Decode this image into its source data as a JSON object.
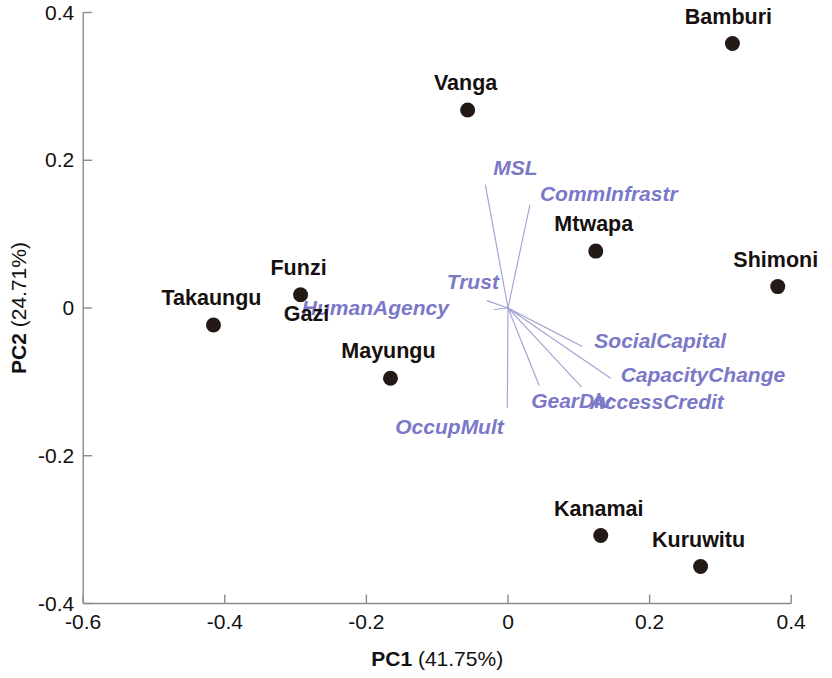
{
  "chart_data": {
    "type": "scatter",
    "title": "",
    "subtitle": "",
    "xlabel_prefix": "PC1",
    "xlabel_variance": "(41.75%)",
    "ylabel_prefix": "PC2",
    "ylabel_variance": "(24.71%)",
    "xlabel": "PC1 (41.75%)",
    "ylabel": "PC2 (24.71%)",
    "xlim": [
      -0.6,
      0.4
    ],
    "ylim": [
      -0.4,
      0.4
    ],
    "xticks": [
      -0.6,
      -0.4,
      -0.2,
      0,
      0.2,
      0.4
    ],
    "xtick_labels": [
      "-0.6",
      "-0.4",
      "-0.2",
      "0",
      "0.2",
      "0.4"
    ],
    "yticks": [
      -0.4,
      -0.2,
      0,
      0.2,
      0.4
    ],
    "ytick_labels": [
      "-0.4",
      "-0.2",
      "0",
      "0.2",
      "0.4"
    ],
    "grid": false,
    "legend": "none",
    "point_color": "#231a16",
    "vector_color": "#7b78c8",
    "sites": [
      {
        "label": "Bamburi",
        "x": 0.317,
        "y": 0.358,
        "label_dx": -4,
        "label_dy": -20
      },
      {
        "label": "Vanga",
        "x": -0.057,
        "y": 0.268,
        "label_dx": -2,
        "label_dy": -20
      },
      {
        "label": "Mtwapa",
        "x": 0.124,
        "y": 0.077,
        "label_dx": -2,
        "label_dy": -20
      },
      {
        "label": "Shimoni",
        "x": 0.381,
        "y": 0.029,
        "label_dx": -2,
        "label_dy": -20
      },
      {
        "label": "Funzi",
        "x": -0.293,
        "y": 0.018,
        "label_dx": -2,
        "label_dy": -20
      },
      {
        "label": "Gazi",
        "x": -0.293,
        "y": 0.018,
        "label_dx": 6,
        "label_dy": 26
      },
      {
        "label": "Takaungu",
        "x": -0.416,
        "y": -0.023,
        "label_dx": -2,
        "label_dy": -20
      },
      {
        "label": "Mayungu",
        "x": -0.166,
        "y": -0.095,
        "label_dx": -2,
        "label_dy": -20
      },
      {
        "label": "Kanamai",
        "x": 0.131,
        "y": -0.308,
        "label_dx": -2,
        "label_dy": -20
      },
      {
        "label": "Kuruwitu",
        "x": 0.272,
        "y": -0.35,
        "label_dx": -2,
        "label_dy": -20
      }
    ],
    "vectors": [
      {
        "label": "MSL",
        "x": -0.032,
        "y": 0.167,
        "label_dx": 8,
        "label_dy": -10
      },
      {
        "label": "CommInfrastr",
        "x": 0.031,
        "y": 0.14,
        "label_dx": 10,
        "label_dy": -4
      },
      {
        "label": "Trust",
        "x": -0.03,
        "y": 0.01,
        "label_dx": -40,
        "label_dy": -12
      },
      {
        "label": "HumanAgency",
        "x": -0.02,
        "y": -0.002,
        "label_dx": -192,
        "label_dy": 6
      },
      {
        "label": "SocialCapital",
        "x": 0.105,
        "y": -0.052,
        "label_dx": 12,
        "label_dy": 2
      },
      {
        "label": "CapacityChange",
        "x": 0.145,
        "y": -0.095,
        "label_dx": 10,
        "label_dy": 4
      },
      {
        "label": "AccessCredit",
        "x": 0.104,
        "y": -0.107,
        "label_dx": 8,
        "label_dy": 22
      },
      {
        "label": "GearDiv",
        "x": 0.044,
        "y": -0.105,
        "label_dx": -8,
        "label_dy": 22
      },
      {
        "label": "OccupMult",
        "x": -0.001,
        "y": -0.135,
        "label_dx": -112,
        "label_dy": 26
      }
    ]
  }
}
